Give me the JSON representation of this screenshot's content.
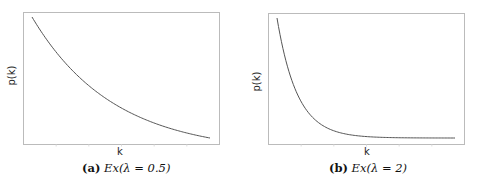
{
  "chart_data": [
    {
      "type": "line",
      "title": "",
      "caption_tag": "(a)",
      "caption_expr": "Ex(λ = 0.5)",
      "xlabel": "k",
      "ylabel": "p(k)",
      "grid": false,
      "legend": null,
      "xticks_labels": [],
      "yticks_labels": [],
      "function": "p(k) = λ·e^(−λk)",
      "lambda": 0.5,
      "xlim": [
        0,
        4.4
      ],
      "x": [
        0,
        0.5,
        1,
        1.5,
        2,
        2.5,
        3,
        3.5,
        4,
        4.4
      ],
      "y": [
        0.5,
        0.389,
        0.303,
        0.236,
        0.184,
        0.143,
        0.112,
        0.087,
        0.068,
        0.055
      ],
      "color": "#555555"
    },
    {
      "type": "line",
      "title": "",
      "caption_tag": "(b)",
      "caption_expr": "Ex(λ = 2)",
      "xlabel": "k",
      "ylabel": "p(k)",
      "grid": false,
      "legend": null,
      "xticks_labels": [],
      "yticks_labels": [],
      "function": "p(k) = λ·e^(−λk)",
      "lambda": 2,
      "xlim": [
        0,
        4.4
      ],
      "x": [
        0,
        0.5,
        1,
        1.5,
        2,
        2.5,
        3,
        3.5,
        4,
        4.4
      ],
      "y": [
        2.0,
        0.736,
        0.271,
        0.1,
        0.037,
        0.013,
        0.005,
        0.002,
        0.001,
        0.0003
      ],
      "color": "#555555"
    }
  ],
  "panels": [
    {
      "xlabel": "k",
      "ylabel": "p(k)",
      "caption_tag": "(a)",
      "caption_expr": "Ex(λ = 0.5)"
    },
    {
      "xlabel": "k",
      "ylabel": "p(k)",
      "caption_tag": "(b)",
      "caption_expr": "Ex(λ = 2)"
    }
  ]
}
